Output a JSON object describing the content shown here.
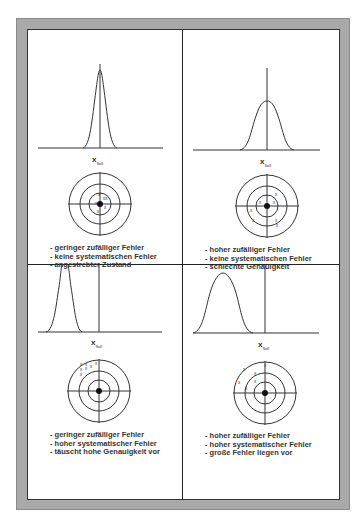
{
  "panels": [
    {
      "xlabel": "x",
      "xlabel_sub": "Soll",
      "curve": {
        "offset": 0,
        "width": 8,
        "height": 88
      },
      "bullets": [
        "geringer zufälliger Fehler",
        "keine systematischen Fehler",
        "angestrebter Zustand"
      ]
    },
    {
      "xlabel": "x",
      "xlabel_sub": "Soll",
      "curve": {
        "offset": 0,
        "width": 13,
        "height": 50
      },
      "bullets": [
        "hoher zufälliger Fehler",
        "keine systematischen Fehler",
        "schlechte Genauigkeit"
      ]
    },
    {
      "xlabel": "x",
      "xlabel_sub": "Soll",
      "curve": {
        "offset": -37,
        "width": 8,
        "height": 80
      },
      "bullets": [
        "geringer zufälliger Fehler",
        "hoher systematischer Fehler",
        "täuscht hohe Genauigkeit vor"
      ]
    },
    {
      "xlabel": "x",
      "xlabel_sub": "Soll",
      "curve": {
        "offset": -36,
        "width": 13,
        "height": 62
      },
      "bullets": [
        "hoher zufälliger Fehler",
        "hoher systematischer Fehler",
        "große Fehler liegen vor"
      ]
    }
  ]
}
